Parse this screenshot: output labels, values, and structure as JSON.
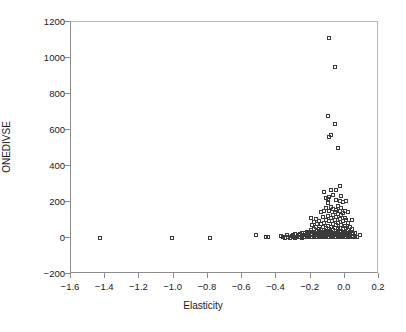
{
  "chart_data": {
    "type": "scatter",
    "title": "",
    "xlabel": "Elasticity",
    "ylabel": "ONEDIVSE",
    "xlim": [
      -1.6,
      0.2
    ],
    "ylim": [
      -200,
      1200
    ],
    "xticks": [
      -1.6,
      -1.4,
      -1.2,
      -1.0,
      -0.8,
      -0.6,
      -0.4,
      -0.2,
      0.0,
      0.2
    ],
    "xticklabels": [
      "−1.6",
      "−1.4",
      "−1.2",
      "−1.0",
      "−0.8",
      "−0.6",
      "−0.4",
      "−0.2",
      "0.0",
      "0.2"
    ],
    "yticks": [
      -200,
      0,
      200,
      400,
      600,
      800,
      1000,
      1200
    ],
    "yticklabels": [
      "−200",
      "0",
      "200",
      "400",
      "600",
      "800",
      "1000",
      "1200"
    ],
    "grid": false,
    "legend": null,
    "marker": "open-square",
    "marker_color": "#3a3a3a",
    "points": [
      [
        -1.43,
        2
      ],
      [
        -1.01,
        2
      ],
      [
        -0.79,
        2
      ],
      [
        -0.52,
        14
      ],
      [
        -0.46,
        4
      ],
      [
        -0.45,
        4
      ],
      [
        -0.37,
        10
      ],
      [
        -0.36,
        4
      ],
      [
        -0.35,
        2
      ],
      [
        -0.34,
        14
      ],
      [
        -0.33,
        6
      ],
      [
        -0.32,
        2
      ],
      [
        -0.31,
        10
      ],
      [
        -0.3,
        4
      ],
      [
        -0.3,
        16
      ],
      [
        -0.29,
        2
      ],
      [
        -0.29,
        20
      ],
      [
        -0.28,
        6
      ],
      [
        -0.27,
        3
      ],
      [
        -0.27,
        14
      ],
      [
        -0.26,
        5
      ],
      [
        -0.26,
        22
      ],
      [
        -0.25,
        2
      ],
      [
        -0.25,
        12
      ],
      [
        -0.25,
        28
      ],
      [
        -0.24,
        6
      ],
      [
        -0.24,
        18
      ],
      [
        -0.23,
        4
      ],
      [
        -0.23,
        26
      ],
      [
        -0.22,
        8
      ],
      [
        -0.22,
        20
      ],
      [
        -0.22,
        36
      ],
      [
        -0.21,
        4
      ],
      [
        -0.21,
        14
      ],
      [
        -0.21,
        30
      ],
      [
        -0.2,
        6
      ],
      [
        -0.2,
        22
      ],
      [
        -0.2,
        44
      ],
      [
        -0.2,
        112
      ],
      [
        -0.19,
        5
      ],
      [
        -0.19,
        18
      ],
      [
        -0.19,
        34
      ],
      [
        -0.19,
        70
      ],
      [
        -0.18,
        8
      ],
      [
        -0.18,
        24
      ],
      [
        -0.18,
        48
      ],
      [
        -0.18,
        90
      ],
      [
        -0.17,
        4
      ],
      [
        -0.17,
        16
      ],
      [
        -0.17,
        30
      ],
      [
        -0.17,
        62
      ],
      [
        -0.17,
        108
      ],
      [
        -0.16,
        6
      ],
      [
        -0.16,
        20
      ],
      [
        -0.16,
        40
      ],
      [
        -0.16,
        76
      ],
      [
        -0.15,
        3
      ],
      [
        -0.15,
        14
      ],
      [
        -0.15,
        28
      ],
      [
        -0.15,
        52
      ],
      [
        -0.15,
        96
      ],
      [
        -0.14,
        8
      ],
      [
        -0.14,
        22
      ],
      [
        -0.14,
        44
      ],
      [
        -0.14,
        80
      ],
      [
        -0.14,
        142
      ],
      [
        -0.13,
        5
      ],
      [
        -0.13,
        18
      ],
      [
        -0.13,
        34
      ],
      [
        -0.13,
        60
      ],
      [
        -0.13,
        118
      ],
      [
        -0.12,
        9
      ],
      [
        -0.12,
        24
      ],
      [
        -0.12,
        46
      ],
      [
        -0.12,
        86
      ],
      [
        -0.12,
        150
      ],
      [
        -0.12,
        256
      ],
      [
        -0.11,
        4
      ],
      [
        -0.11,
        16
      ],
      [
        -0.11,
        30
      ],
      [
        -0.11,
        56
      ],
      [
        -0.11,
        100
      ],
      [
        -0.11,
        168
      ],
      [
        -0.11,
        222
      ],
      [
        -0.1,
        7
      ],
      [
        -0.1,
        20
      ],
      [
        -0.1,
        38
      ],
      [
        -0.1,
        68
      ],
      [
        -0.1,
        124
      ],
      [
        -0.1,
        196
      ],
      [
        -0.1,
        216
      ],
      [
        -0.1,
        676
      ],
      [
        -0.09,
        3
      ],
      [
        -0.09,
        14
      ],
      [
        -0.09,
        28
      ],
      [
        -0.09,
        50
      ],
      [
        -0.09,
        92
      ],
      [
        -0.09,
        152
      ],
      [
        -0.09,
        230
      ],
      [
        -0.09,
        560
      ],
      [
        -0.09,
        1110
      ],
      [
        -0.08,
        6
      ],
      [
        -0.08,
        18
      ],
      [
        -0.08,
        34
      ],
      [
        -0.08,
        62
      ],
      [
        -0.08,
        110
      ],
      [
        -0.08,
        172
      ],
      [
        -0.08,
        266
      ],
      [
        -0.08,
        570
      ],
      [
        -0.07,
        9
      ],
      [
        -0.07,
        22
      ],
      [
        -0.07,
        42
      ],
      [
        -0.07,
        78
      ],
      [
        -0.07,
        130
      ],
      [
        -0.07,
        162
      ],
      [
        -0.07,
        240
      ],
      [
        -0.06,
        4
      ],
      [
        -0.06,
        16
      ],
      [
        -0.06,
        30
      ],
      [
        -0.06,
        54
      ],
      [
        -0.06,
        98
      ],
      [
        -0.06,
        144
      ],
      [
        -0.06,
        634
      ],
      [
        -0.06,
        950
      ],
      [
        -0.05,
        8
      ],
      [
        -0.05,
        20
      ],
      [
        -0.05,
        38
      ],
      [
        -0.05,
        70
      ],
      [
        -0.05,
        118
      ],
      [
        -0.05,
        158
      ],
      [
        -0.05,
        212
      ],
      [
        -0.05,
        268
      ],
      [
        -0.04,
        3
      ],
      [
        -0.04,
        14
      ],
      [
        -0.04,
        26
      ],
      [
        -0.04,
        48
      ],
      [
        -0.04,
        86
      ],
      [
        -0.04,
        136
      ],
      [
        -0.04,
        176
      ],
      [
        -0.04,
        500
      ],
      [
        -0.03,
        6
      ],
      [
        -0.03,
        18
      ],
      [
        -0.03,
        32
      ],
      [
        -0.03,
        58
      ],
      [
        -0.03,
        104
      ],
      [
        -0.03,
        150
      ],
      [
        -0.03,
        206
      ],
      [
        -0.03,
        288
      ],
      [
        -0.02,
        9
      ],
      [
        -0.02,
        22
      ],
      [
        -0.02,
        40
      ],
      [
        -0.02,
        74
      ],
      [
        -0.02,
        126
      ],
      [
        -0.02,
        164
      ],
      [
        -0.02,
        234
      ],
      [
        -0.01,
        4
      ],
      [
        -0.01,
        16
      ],
      [
        -0.01,
        28
      ],
      [
        -0.01,
        52
      ],
      [
        -0.01,
        94
      ],
      [
        -0.01,
        140
      ],
      [
        -0.01,
        202
      ],
      [
        0.0,
        7
      ],
      [
        0.0,
        20
      ],
      [
        0.0,
        36
      ],
      [
        0.0,
        66
      ],
      [
        0.0,
        112
      ],
      [
        0.0,
        148
      ],
      [
        0.01,
        3
      ],
      [
        0.01,
        15
      ],
      [
        0.01,
        30
      ],
      [
        0.01,
        56
      ],
      [
        0.01,
        100
      ],
      [
        0.01,
        206
      ],
      [
        0.02,
        8
      ],
      [
        0.02,
        24
      ],
      [
        0.02,
        44
      ],
      [
        0.02,
        82
      ],
      [
        0.02,
        146
      ],
      [
        0.03,
        5
      ],
      [
        0.03,
        18
      ],
      [
        0.03,
        34
      ],
      [
        0.03,
        62
      ],
      [
        0.04,
        12
      ],
      [
        0.04,
        26
      ],
      [
        0.04,
        50
      ],
      [
        0.04,
        100
      ],
      [
        0.05,
        6
      ],
      [
        0.05,
        22
      ],
      [
        0.06,
        10
      ],
      [
        0.06,
        30
      ],
      [
        0.07,
        8
      ],
      [
        0.09,
        18
      ]
    ]
  }
}
